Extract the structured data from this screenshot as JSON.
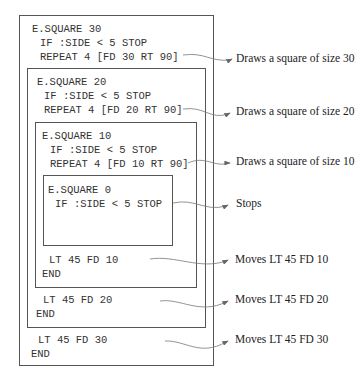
{
  "levels": [
    {
      "call": "E.SQUARE 30",
      "condition": "IF :SIDE < 5 STOP",
      "repeat": "REPEAT 4 [FD 30 RT 90]",
      "move": "LT 45 FD 30",
      "end": "END",
      "draw_annotation": "Draws a square of size 30",
      "move_annotation": "Moves LT 45 FD 30"
    },
    {
      "call": "E.SQUARE 20",
      "condition": "IF :SIDE < 5 STOP",
      "repeat": "REPEAT 4 [FD 20 RT 90]",
      "move": "LT 45 FD 20",
      "end": "END",
      "draw_annotation": "Draws a square of size 20",
      "move_annotation": "Moves LT 45 FD 20"
    },
    {
      "call": "E.SQUARE 10",
      "condition": "IF :SIDE < 5 STOP",
      "repeat": "REPEAT 4 [FD 10 RT 90]",
      "move": "LT 45 FD 10",
      "end": "END",
      "draw_annotation": "Draws a square of size 10",
      "move_annotation": "Moves LT 45 FD 10"
    },
    {
      "call": "E.SQUARE 0",
      "condition": "IF :SIDE < 5 STOP",
      "stop_annotation": "Stops"
    }
  ],
  "colors": {
    "line": "#555555",
    "text": "#333333",
    "arrow": "#777777"
  }
}
